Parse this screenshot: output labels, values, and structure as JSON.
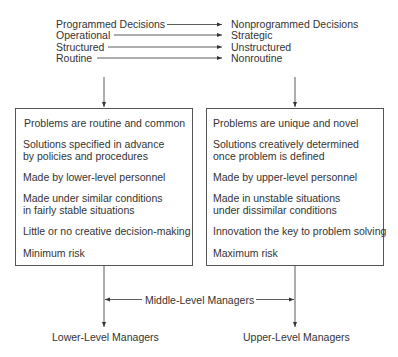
{
  "header_pairs": [
    {
      "left": "Programmed Decisions",
      "right": "Nonprogrammed Decisions"
    },
    {
      "left": "Operational",
      "right": "Strategic"
    },
    {
      "left": "Structured",
      "right": "Unstructured"
    },
    {
      "left": "Routine",
      "right": "Nonroutine"
    }
  ],
  "left_box": {
    "items": [
      "Problems are routine and common",
      "Solutions specified in advance",
      "by policies and procedures",
      "Made by lower-level personnel",
      "Made under similar conditions",
      "in fairly stable situations",
      "Little or no creative decision-making",
      "Minimum risk"
    ]
  },
  "right_box": {
    "items": [
      "Problems are unique and novel",
      "Solutions creatively determined",
      "once problem is defined",
      "Made by upper-level personnel",
      "Made in unstable situations",
      "under dissimilar conditions",
      "Innovation the key to problem solving",
      "Maximum risk"
    ]
  },
  "middle_label": "Middle-Level Managers",
  "bottom_labels": {
    "left": "Lower-Level Managers",
    "right": "Upper-Level Managers"
  }
}
